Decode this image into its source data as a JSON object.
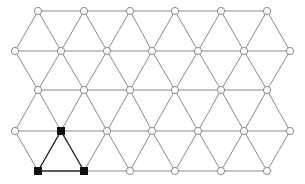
{
  "diagram": {
    "type": "triangular-lattice",
    "colors": {
      "background": "#ffffff",
      "edge": "#8a8a8a",
      "node_fill": "#ffffff",
      "highlight": "#111111"
    },
    "rows": [
      {
        "y": 11,
        "x": [
          38,
          84,
          130,
          175,
          221,
          267
        ]
      },
      {
        "y": 51,
        "x": [
          15,
          61,
          107,
          152,
          198,
          244,
          290
        ]
      },
      {
        "y": 90,
        "x": [
          38,
          84,
          130,
          175,
          221,
          267
        ]
      },
      {
        "y": 131,
        "x": [
          15,
          61,
          107,
          152,
          198,
          244,
          290
        ]
      },
      {
        "y": 171,
        "x": [
          38,
          84,
          130,
          175,
          221,
          267
        ]
      }
    ],
    "highlighted_nodes": [
      [
        3,
        1
      ],
      [
        4,
        0
      ],
      [
        4,
        1
      ]
    ],
    "highlighted_edges": [
      [
        [
          3,
          1
        ],
        [
          4,
          0
        ]
      ],
      [
        [
          3,
          1
        ],
        [
          4,
          1
        ]
      ],
      [
        [
          4,
          0
        ],
        [
          4,
          1
        ]
      ]
    ],
    "node_shapes": {
      "normal": "circle",
      "highlighted": "square"
    }
  }
}
